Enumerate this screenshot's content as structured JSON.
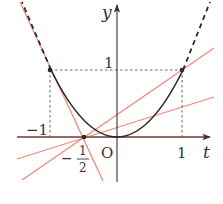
{
  "figure": {
    "type": "function-graph",
    "curve": "y = t^2",
    "axes": {
      "x_label": "t",
      "y_label": "y",
      "origin_label": "O"
    },
    "tick_labels": {
      "x_neg_one": "−1",
      "x_one": "1",
      "y_one": "1",
      "half_minus": "−",
      "half_num": "1",
      "half_den": "2"
    },
    "points": [
      {
        "name": "A",
        "t": -1,
        "y": 1
      },
      {
        "name": "B",
        "t": 1,
        "y": 1
      },
      {
        "name": "P",
        "t": -0.5,
        "y": 0
      }
    ],
    "lines_through_P": [
      {
        "desc": "horizontal",
        "slope": 0
      },
      {
        "desc": "through (-1,1)",
        "slope": -2
      },
      {
        "desc": "through (1,1)",
        "slope": 0.667
      },
      {
        "desc": "shallow",
        "slope": 0.3
      }
    ],
    "colors": {
      "curve": "#2a2a2a",
      "lines": "#f08878",
      "axis": "#333333",
      "guides": "#555555"
    }
  }
}
